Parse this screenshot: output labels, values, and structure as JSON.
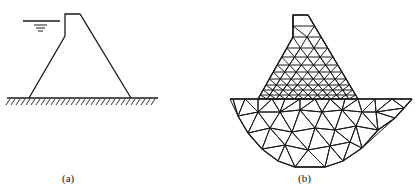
{
  "figure": {
    "panels": [
      {
        "id": "a",
        "caption": "(a)",
        "description": "Gravity dam cross-section with upstream water level and rigid foundation"
      },
      {
        "id": "b",
        "caption": "(b)",
        "description": "Finite element triangular mesh of dam body and foundation"
      }
    ],
    "colors": {
      "line": "#1a1a1a",
      "background": "#ffffff"
    }
  }
}
